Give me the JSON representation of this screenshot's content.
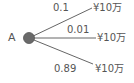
{
  "tree": {
    "root": {
      "label": "A",
      "color": "#666666"
    },
    "branches": [
      {
        "probability": "0.1",
        "outcome": "¥10万"
      },
      {
        "probability": "0.01",
        "outcome": "¥10万"
      },
      {
        "probability": "0.89",
        "outcome": "¥10万"
      }
    ],
    "line_color": "#666666",
    "text_color": "#555555"
  }
}
